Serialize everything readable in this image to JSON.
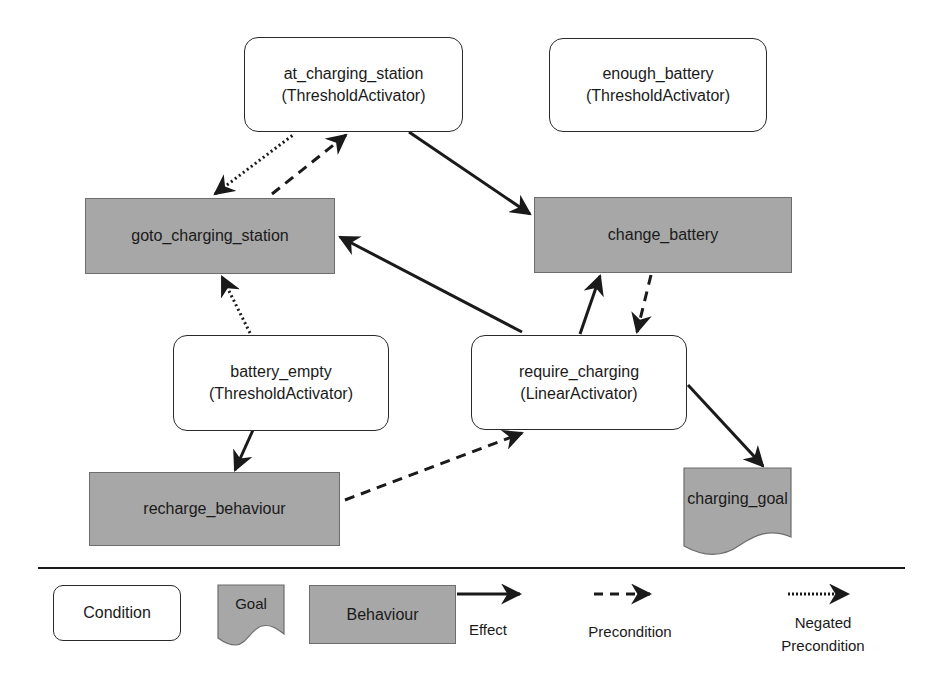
{
  "diagram": {
    "nodes": {
      "at_charging_station": {
        "name": "at_charging_station",
        "type": "(ThresholdActivator)"
      },
      "enough_battery": {
        "name": "enough_battery",
        "type": "(ThresholdActivator)"
      },
      "goto_charging_station": {
        "name": "goto_charging_station"
      },
      "change_battery": {
        "name": "change_battery"
      },
      "battery_empty": {
        "name": "battery_empty",
        "type": "(ThresholdActivator)"
      },
      "require_charging": {
        "name": "require_charging",
        "type": "(LinearActivator)"
      },
      "recharge_behaviour": {
        "name": "recharge_behaviour"
      },
      "charging_goal": {
        "name": "charging_goal"
      }
    },
    "edges": [
      {
        "from": "goto_charging_station",
        "to": "at_charging_station",
        "kind": "Negated Precondition"
      },
      {
        "from": "at_charging_station",
        "to": "goto_charging_station",
        "kind": "Precondition"
      },
      {
        "from": "at_charging_station",
        "to": "change_battery",
        "kind": "Effect"
      },
      {
        "from": "require_charging",
        "to": "goto_charging_station",
        "kind": "Effect"
      },
      {
        "from": "require_charging",
        "to": "change_battery",
        "kind": "Effect"
      },
      {
        "from": "change_battery",
        "to": "require_charging",
        "kind": "Precondition"
      },
      {
        "from": "battery_empty",
        "to": "goto_charging_station",
        "kind": "Negated Precondition"
      },
      {
        "from": "battery_empty",
        "to": "recharge_behaviour",
        "kind": "Effect"
      },
      {
        "from": "recharge_behaviour",
        "to": "require_charging",
        "kind": "Precondition"
      },
      {
        "from": "require_charging",
        "to": "charging_goal",
        "kind": "Effect"
      }
    ]
  },
  "legend": {
    "condition": "Condition",
    "goal": "Goal",
    "behaviour": "Behaviour",
    "effect": "Effect",
    "precondition": "Precondition",
    "negated_line1": "Negated",
    "negated_line2": "Precondition"
  },
  "colors": {
    "behaviour_fill": "#a7a7a7",
    "condition_fill": "#ffffff",
    "stroke": "#1a1a1a"
  }
}
